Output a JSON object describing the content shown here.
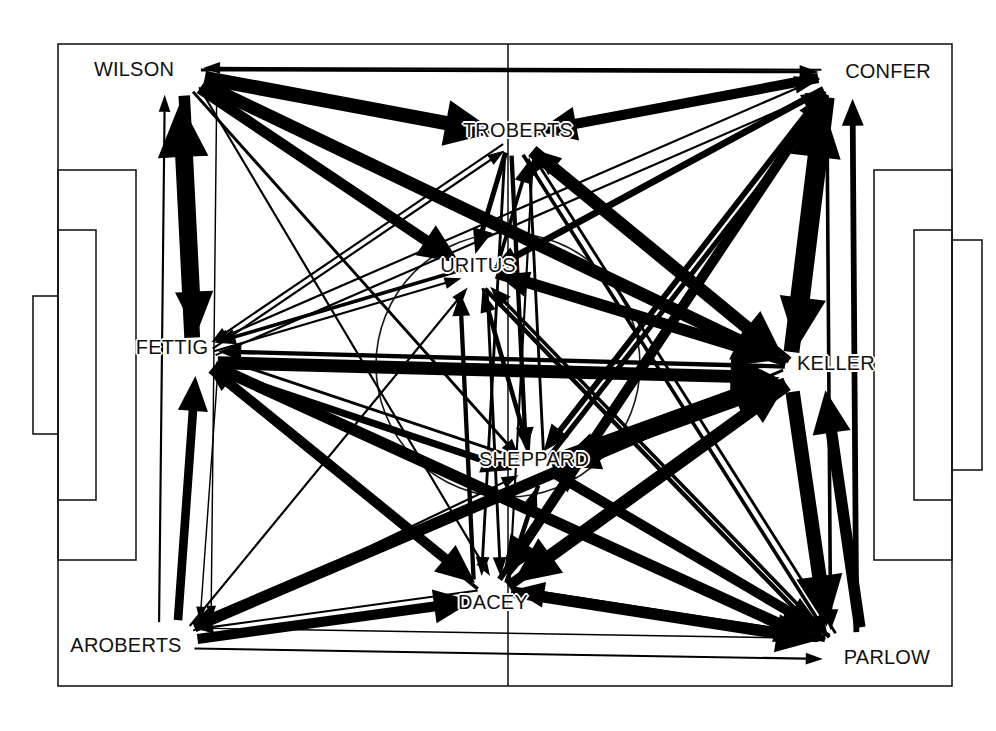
{
  "figure": {
    "title": "",
    "type": "passing-network",
    "background": "soccer-pitch",
    "width": 996,
    "height": 731,
    "ink_color": "#000000",
    "pitch_line_color": "#1a1a1a"
  },
  "pitch": {
    "left": 58,
    "top": 44,
    "right": 952,
    "bottom": 686,
    "halfway_line_x": 508,
    "center_circle_cx": 508,
    "center_circle_cy": 365,
    "center_circle_r": 132,
    "penalty_box_left": {
      "x": 58,
      "y": 170,
      "w": 78,
      "h": 390
    },
    "penalty_box_right": {
      "x": 874,
      "y": 170,
      "w": 78,
      "h": 390
    },
    "goal_box_left": {
      "x": 33,
      "y": 296,
      "w": 25,
      "h": 138
    },
    "goal_box_right": {
      "x": 952,
      "y": 240,
      "w": 30,
      "h": 230
    }
  },
  "nodes": [
    {
      "id": "WILSON",
      "label": "WILSON",
      "x": 134,
      "y": 69,
      "anchor_x": 186,
      "anchor_y": 78
    },
    {
      "id": "CONFER",
      "label": "CONFER",
      "x": 888,
      "y": 71,
      "anchor_x": 836,
      "anchor_y": 80
    },
    {
      "id": "TROBERTS",
      "label": "TROBERTS",
      "x": 518,
      "y": 130,
      "anchor_x": 518,
      "anchor_y": 140
    },
    {
      "id": "URITUS",
      "label": "URITUS",
      "x": 478,
      "y": 265,
      "anchor_x": 478,
      "anchor_y": 274
    },
    {
      "id": "FETTIG",
      "label": "FETTIG",
      "x": 172,
      "y": 347,
      "anchor_x": 200,
      "anchor_y": 356
    },
    {
      "id": "KELLER",
      "label": "KELLER",
      "x": 836,
      "y": 363,
      "anchor_x": 800,
      "anchor_y": 372
    },
    {
      "id": "SHEPPARD",
      "label": "SHEPPARD",
      "x": 534,
      "y": 459,
      "anchor_x": 534,
      "anchor_y": 468
    },
    {
      "id": "DACEY",
      "label": "DACEY",
      "x": 493,
      "y": 602,
      "anchor_x": 493,
      "anchor_y": 594
    },
    {
      "id": "AROBERTS",
      "label": "AROBERTS",
      "x": 126,
      "y": 645,
      "anchor_x": 180,
      "anchor_y": 637
    },
    {
      "id": "PARLOW",
      "label": "PARLOW",
      "x": 887,
      "y": 657,
      "anchor_x": 840,
      "anchor_y": 648
    }
  ],
  "chart_data": {
    "type": "network",
    "title": "",
    "nodes": [
      "WILSON",
      "CONFER",
      "TROBERTS",
      "URITUS",
      "FETTIG",
      "KELLER",
      "SHEPPARD",
      "DACEY",
      "AROBERTS",
      "PARLOW"
    ],
    "edge_encoding": "arrow thickness = pass volume; arrowhead = direction",
    "edges": [
      {
        "from": "WILSON",
        "to": "CONFER",
        "w": 4,
        "ox": 0,
        "oy": -18,
        "curve": 0
      },
      {
        "from": "WILSON",
        "to": "TROBERTS",
        "w": 20,
        "ox": 0,
        "oy": 2,
        "curve": 0
      },
      {
        "from": "WILSON",
        "to": "URITUS",
        "w": 15,
        "ox": 4,
        "oy": 6,
        "curve": 0
      },
      {
        "from": "WILSON",
        "to": "KELLER",
        "w": 18,
        "ox": -6,
        "oy": 10,
        "curve": 0
      },
      {
        "from": "WILSON",
        "to": "SHEPPARD",
        "w": 4,
        "ox": 4,
        "oy": 4,
        "curve": 0
      },
      {
        "from": "WILSON",
        "to": "DACEY",
        "w": 3,
        "ox": -6,
        "oy": 2,
        "curve": 0
      },
      {
        "from": "WILSON",
        "to": "FETTIG",
        "w": 16,
        "ox": 6,
        "oy": 0,
        "curve": 0
      },
      {
        "from": "FETTIG",
        "to": "WILSON",
        "w": 22,
        "ox": -16,
        "oy": 0,
        "curve": 0
      },
      {
        "from": "FETTIG",
        "to": "AROBERTS",
        "w": 2,
        "ox": -30,
        "oy": 0,
        "curve": 0
      },
      {
        "from": "AROBERTS",
        "to": "FETTIG",
        "w": 12,
        "ox": -4,
        "oy": 0,
        "curve": 0
      },
      {
        "from": "AROBERTS",
        "to": "WILSON",
        "w": 3,
        "ox": -46,
        "oy": 0,
        "curve": 0
      },
      {
        "from": "WILSON",
        "to": "AROBERTS",
        "w": 2,
        "ox": -60,
        "oy": 0,
        "curve": 0
      },
      {
        "from": "FETTIG",
        "to": "TROBERTS",
        "w": 3,
        "ox": 0,
        "oy": -6,
        "curve": 0
      },
      {
        "from": "FETTIG",
        "to": "URITUS",
        "w": 3,
        "ox": 0,
        "oy": 0,
        "curve": 0
      },
      {
        "from": "FETTIG",
        "to": "CONFER",
        "w": 3,
        "ox": 0,
        "oy": 6,
        "curve": 0
      },
      {
        "from": "FETTIG",
        "to": "KELLER",
        "w": 18,
        "ox": 0,
        "oy": 10,
        "curve": 0
      },
      {
        "from": "FETTIG",
        "to": "SHEPPARD",
        "w": 10,
        "ox": 0,
        "oy": 14,
        "curve": 0
      },
      {
        "from": "FETTIG",
        "to": "DACEY",
        "w": 14,
        "ox": 0,
        "oy": 4,
        "curve": 0
      },
      {
        "from": "FETTIG",
        "to": "PARLOW",
        "w": 16,
        "ox": 0,
        "oy": 18,
        "curve": 0
      },
      {
        "from": "AROBERTS",
        "to": "DACEY",
        "w": 14,
        "ox": 0,
        "oy": 0,
        "curve": 0
      },
      {
        "from": "AROBERTS",
        "to": "SHEPPARD",
        "w": 3,
        "ox": 0,
        "oy": -6,
        "curve": 0
      },
      {
        "from": "AROBERTS",
        "to": "KELLER",
        "w": 14,
        "ox": 0,
        "oy": -4,
        "curve": 0
      },
      {
        "from": "AROBERTS",
        "to": "PARLOW",
        "w": 3,
        "ox": 0,
        "oy": 30,
        "curve": 0
      },
      {
        "from": "AROBERTS",
        "to": "URITUS",
        "w": 3,
        "ox": 0,
        "oy": -10,
        "curve": 0
      },
      {
        "from": "TROBERTS",
        "to": "CONFER",
        "w": 6,
        "ox": 0,
        "oy": -4,
        "curve": 0
      },
      {
        "from": "CONFER",
        "to": "TROBERTS",
        "w": 14,
        "ox": 0,
        "oy": 8,
        "curve": 0
      },
      {
        "from": "TROBERTS",
        "to": "URITUS",
        "w": 7,
        "ox": 10,
        "oy": 0,
        "curve": 0
      },
      {
        "from": "URITUS",
        "to": "TROBERTS",
        "w": 5,
        "ox": 24,
        "oy": 0,
        "curve": 0
      },
      {
        "from": "TROBERTS",
        "to": "KELLER",
        "w": 18,
        "ox": 0,
        "oy": 4,
        "curve": 0
      },
      {
        "from": "TROBERTS",
        "to": "SHEPPARD",
        "w": 6,
        "ox": 14,
        "oy": 0,
        "curve": 0
      },
      {
        "from": "TROBERTS",
        "to": "DACEY",
        "w": 4,
        "ox": 20,
        "oy": 0,
        "curve": 0
      },
      {
        "from": "TROBERTS",
        "to": "PARLOW",
        "w": 5,
        "ox": 0,
        "oy": 0,
        "curve": 0
      },
      {
        "from": "CONFER",
        "to": "URITUS",
        "w": 6,
        "ox": 0,
        "oy": -4,
        "curve": 0
      },
      {
        "from": "CONFER",
        "to": "KELLER",
        "w": 20,
        "ox": 8,
        "oy": 0,
        "curve": 0
      },
      {
        "from": "KELLER",
        "to": "CONFER",
        "w": 22,
        "ox": -12,
        "oy": 0,
        "curve": 0
      },
      {
        "from": "CONFER",
        "to": "SHEPPARD",
        "w": 8,
        "ox": 0,
        "oy": -6,
        "curve": 0
      },
      {
        "from": "CONFER",
        "to": "DACEY",
        "w": 14,
        "ox": 0,
        "oy": 6,
        "curve": 0
      },
      {
        "from": "CONFER",
        "to": "PARLOW",
        "w": 5,
        "ox": 16,
        "oy": 0,
        "curve": 0
      },
      {
        "from": "PARLOW",
        "to": "CONFER",
        "w": 8,
        "ox": 30,
        "oy": 0,
        "curve": 0
      },
      {
        "from": "URITUS",
        "to": "KELLER",
        "w": 16,
        "ox": 0,
        "oy": -6,
        "curve": 0
      },
      {
        "from": "KELLER",
        "to": "URITUS",
        "w": 10,
        "ox": 0,
        "oy": 8,
        "curve": 0
      },
      {
        "from": "URITUS",
        "to": "SHEPPARD",
        "w": 4,
        "ox": -8,
        "oy": 0,
        "curve": 0
      },
      {
        "from": "SHEPPARD",
        "to": "URITUS",
        "w": 5,
        "ox": 6,
        "oy": 0,
        "curve": 0
      },
      {
        "from": "URITUS",
        "to": "DACEY",
        "w": 4,
        "ox": -22,
        "oy": 0,
        "curve": 0
      },
      {
        "from": "DACEY",
        "to": "URITUS",
        "w": 6,
        "ox": -34,
        "oy": 0,
        "curve": 0
      },
      {
        "from": "URITUS",
        "to": "PARLOW",
        "w": 6,
        "ox": 0,
        "oy": 6,
        "curve": 0
      },
      {
        "from": "KELLER",
        "to": "SHEPPARD",
        "w": 16,
        "ox": 0,
        "oy": -8,
        "curve": 0
      },
      {
        "from": "SHEPPARD",
        "to": "KELLER",
        "w": 18,
        "ox": 0,
        "oy": 10,
        "curve": 0
      },
      {
        "from": "KELLER",
        "to": "DACEY",
        "w": 18,
        "ox": 0,
        "oy": -8,
        "curve": 0
      },
      {
        "from": "DACEY",
        "to": "KELLER",
        "w": 14,
        "ox": 0,
        "oy": 12,
        "curve": 0
      },
      {
        "from": "KELLER",
        "to": "PARLOW",
        "w": 20,
        "ox": 14,
        "oy": 0,
        "curve": 0
      },
      {
        "from": "PARLOW",
        "to": "KELLER",
        "w": 16,
        "ox": 36,
        "oy": 0,
        "curve": 0
      },
      {
        "from": "KELLER",
        "to": "TROBERTS",
        "w": 8,
        "ox": 0,
        "oy": 12,
        "curve": 0
      },
      {
        "from": "SHEPPARD",
        "to": "DACEY",
        "w": 6,
        "ox": -10,
        "oy": 0,
        "curve": 0
      },
      {
        "from": "DACEY",
        "to": "SHEPPARD",
        "w": 4,
        "ox": 12,
        "oy": 0,
        "curve": 0
      },
      {
        "from": "SHEPPARD",
        "to": "PARLOW",
        "w": 14,
        "ox": 0,
        "oy": -6,
        "curve": 0
      },
      {
        "from": "PARLOW",
        "to": "SHEPPARD",
        "w": 6,
        "ox": 0,
        "oy": 10,
        "curve": 0
      },
      {
        "from": "DACEY",
        "to": "PARLOW",
        "w": 16,
        "ox": 0,
        "oy": -6,
        "curve": 0
      },
      {
        "from": "PARLOW",
        "to": "DACEY",
        "w": 10,
        "ox": 0,
        "oy": 12,
        "curve": 0
      },
      {
        "from": "DACEY",
        "to": "CONFER",
        "w": 8,
        "ox": -10,
        "oy": 0,
        "curve": 0
      },
      {
        "from": "SHEPPARD",
        "to": "CONFER",
        "w": 7,
        "ox": 12,
        "oy": 0,
        "curve": 0
      },
      {
        "from": "PARLOW",
        "to": "TROBERTS",
        "w": 4,
        "ox": 10,
        "oy": 0,
        "curve": 0
      },
      {
        "from": "PARLOW",
        "to": "URITUS",
        "w": 5,
        "ox": -8,
        "oy": 0,
        "curve": 0
      },
      {
        "from": "KELLER",
        "to": "FETTIG",
        "w": 6,
        "ox": 0,
        "oy": 16,
        "curve": 0
      },
      {
        "from": "DACEY",
        "to": "FETTIG",
        "w": 5,
        "ox": 0,
        "oy": -14,
        "curve": 0
      },
      {
        "from": "DACEY",
        "to": "AROBERTS",
        "w": 3,
        "ox": 0,
        "oy": 14,
        "curve": 0
      },
      {
        "from": "URITUS",
        "to": "FETTIG",
        "w": 5,
        "ox": 0,
        "oy": 14,
        "curve": 0
      },
      {
        "from": "CONFER",
        "to": "FETTIG",
        "w": 3,
        "ox": 0,
        "oy": 18,
        "curve": 0
      },
      {
        "from": "TROBERTS",
        "to": "FETTIG",
        "w": 3,
        "ox": 0,
        "oy": 14,
        "curve": 0
      },
      {
        "from": "SHEPPARD",
        "to": "FETTIG",
        "w": 4,
        "ox": 0,
        "oy": 18,
        "curve": 0
      },
      {
        "from": "PARLOW",
        "to": "AROBERTS",
        "w": 2,
        "ox": 0,
        "oy": 38,
        "curve": 0
      },
      {
        "from": "KELLER",
        "to": "AROBERTS",
        "w": 4,
        "ox": 0,
        "oy": 14,
        "curve": 0
      },
      {
        "from": "CONFER",
        "to": "WILSON",
        "w": 3,
        "ox": 0,
        "oy": 26,
        "curve": 0
      },
      {
        "from": "KELLER",
        "to": "WILSON",
        "w": 4,
        "ox": 0,
        "oy": 22,
        "curve": 0
      },
      {
        "from": "URITUS",
        "to": "CONFER",
        "w": 5,
        "ox": 0,
        "oy": 12,
        "curve": 0
      },
      {
        "from": "SHEPPARD",
        "to": "TROBERTS",
        "w": 4,
        "ox": 26,
        "oy": 0,
        "curve": 0
      },
      {
        "from": "DACEY",
        "to": "TROBERTS",
        "w": 3,
        "ox": 30,
        "oy": 0,
        "curve": 0
      }
    ]
  }
}
